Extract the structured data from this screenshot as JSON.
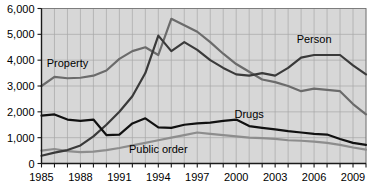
{
  "chart_data": {
    "type": "line",
    "title": "",
    "subtitle": "",
    "xlabel": "",
    "ylabel": "",
    "xlim": [
      1985,
      2010
    ],
    "ylim": [
      0,
      6000
    ],
    "grid": true,
    "legend_position": "inline-labels",
    "y_ticks": [
      0,
      1000,
      2000,
      3000,
      4000,
      5000,
      6000
    ],
    "y_tick_labels": [
      "0",
      "1,000",
      "2,000",
      "3,000",
      "4,000",
      "5,000",
      "6,000"
    ],
    "x_ticks": [
      1985,
      1986,
      1987,
      1988,
      1989,
      1990,
      1991,
      1992,
      1993,
      1994,
      1995,
      1996,
      1997,
      1998,
      1999,
      2000,
      2001,
      2002,
      2003,
      2004,
      2005,
      2006,
      2007,
      2008,
      2009,
      2010
    ],
    "x_tick_labels_shown": [
      "1985",
      "1988",
      "1991",
      "1994",
      "1997",
      "2000",
      "2003",
      "2006",
      "2009"
    ],
    "x": [
      1985,
      1986,
      1987,
      1988,
      1989,
      1990,
      1991,
      1992,
      1993,
      1994,
      1995,
      1996,
      1997,
      1998,
      1999,
      2000,
      2001,
      2002,
      2003,
      2004,
      2005,
      2006,
      2007,
      2008,
      2009,
      2010
    ],
    "series": [
      {
        "name": "Person",
        "label": "Person",
        "color": "#3a3a3a",
        "label_x": 2006,
        "label_y": 4650,
        "values": [
          300,
          420,
          520,
          700,
          1050,
          1500,
          2000,
          2600,
          3500,
          4950,
          4350,
          4700,
          4400,
          4000,
          3700,
          3450,
          3400,
          3500,
          3400,
          3700,
          4100,
          4200,
          4200,
          4200,
          3800,
          3450
        ]
      },
      {
        "name": "Property",
        "label": "Property",
        "color": "#6b6b6b",
        "label_x": 1987,
        "label_y": 3750,
        "values": [
          3000,
          3350,
          3300,
          3320,
          3400,
          3600,
          4050,
          4350,
          4500,
          4200,
          5600,
          5350,
          5100,
          4700,
          4250,
          3850,
          3550,
          3250,
          3150,
          3000,
          2800,
          2900,
          2850,
          2800,
          2300,
          1900
        ]
      },
      {
        "name": "Drugs",
        "label": "Drugs",
        "color": "#111111",
        "label_x": 2001,
        "label_y": 1780,
        "values": [
          1850,
          1900,
          1700,
          1650,
          1700,
          1100,
          1120,
          1550,
          1750,
          1400,
          1380,
          1500,
          1550,
          1580,
          1650,
          1700,
          1450,
          1380,
          1320,
          1250,
          1200,
          1150,
          1120,
          950,
          800,
          720
        ]
      },
      {
        "name": "Public order",
        "label": "Public order",
        "color": "#8d8d8d",
        "label_x": 1994,
        "label_y": 420,
        "values": [
          500,
          560,
          480,
          440,
          460,
          520,
          600,
          700,
          800,
          900,
          1000,
          1100,
          1200,
          1150,
          1100,
          1050,
          1000,
          980,
          950,
          900,
          880,
          850,
          800,
          720,
          620,
          540
        ]
      }
    ]
  },
  "axes": {
    "y_axis_name": "count-axis",
    "x_axis_name": "year-axis"
  }
}
